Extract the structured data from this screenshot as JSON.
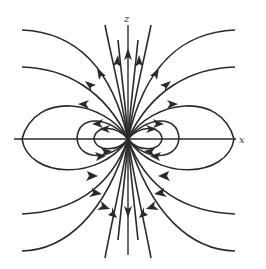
{
  "diagram": {
    "axes": {
      "x_label": "x",
      "z_label": "z"
    },
    "colors": {
      "line": "#2a2a2a",
      "background": "#ffffff"
    }
  }
}
